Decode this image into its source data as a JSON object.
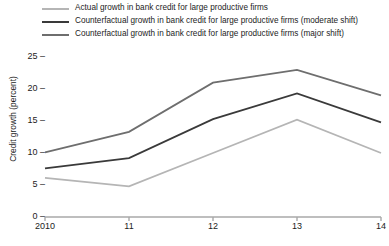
{
  "legend": {
    "items": [
      {
        "label": "Actual growth in bank credit for large productive firms",
        "color": "#b5b5b5",
        "icon": "line-swatch-icon"
      },
      {
        "label": "Counterfactual growth in bank credit for large productive firms (moderate shift)",
        "color": "#3a3a3a",
        "icon": "line-swatch-icon"
      },
      {
        "label": "Counterfactual growth in bank credit for large productive firms (major shift)",
        "color": "#6e6e6e",
        "icon": "line-swatch-icon"
      }
    ]
  },
  "chart_data": {
    "type": "line",
    "title": "",
    "xlabel": "",
    "ylabel": "Credit growth (percent)",
    "x": [
      2010,
      2011,
      2012,
      2013,
      2014
    ],
    "categories": [
      "2010",
      "11",
      "12",
      "13",
      "14"
    ],
    "xlim": [
      2010,
      2014
    ],
    "ylim": [
      0,
      25
    ],
    "yticks": [
      0,
      5,
      10,
      15,
      20,
      25
    ],
    "ytick_labels": [
      "0",
      "5",
      "10",
      "15",
      "20",
      "25"
    ],
    "grid": false,
    "legend_position": "top",
    "series": [
      {
        "name": "Actual growth in bank credit for large productive firms",
        "color": "#b5b5b5",
        "values": [
          6.1,
          4.8,
          10.0,
          15.2,
          10.0
        ]
      },
      {
        "name": "Counterfactual growth in bank credit for large productive firms (moderate shift)",
        "color": "#3a3a3a",
        "values": [
          7.6,
          9.2,
          15.3,
          19.3,
          14.8
        ]
      },
      {
        "name": "Counterfactual growth in bank credit for large productive firms (major shift)",
        "color": "#6e6e6e",
        "values": [
          10.1,
          13.3,
          21.0,
          23.0,
          19.0
        ]
      }
    ]
  },
  "axis": {
    "line_color": "#a8a8a8",
    "text_color": "#1c1c1c"
  }
}
